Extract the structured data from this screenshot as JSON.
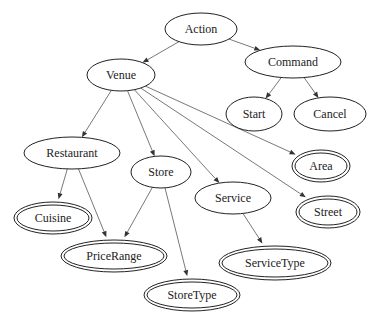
{
  "diagram": {
    "type": "directed-graph",
    "nodes": [
      {
        "id": "action",
        "label": "Action",
        "kind": "single"
      },
      {
        "id": "command",
        "label": "Command",
        "kind": "single"
      },
      {
        "id": "venue",
        "label": "Venue",
        "kind": "single"
      },
      {
        "id": "start",
        "label": "Start",
        "kind": "single"
      },
      {
        "id": "cancel",
        "label": "Cancel",
        "kind": "single"
      },
      {
        "id": "restaurant",
        "label": "Restaurant",
        "kind": "single"
      },
      {
        "id": "store",
        "label": "Store",
        "kind": "single"
      },
      {
        "id": "service",
        "label": "Service",
        "kind": "single"
      },
      {
        "id": "area",
        "label": "Area",
        "kind": "double"
      },
      {
        "id": "street",
        "label": "Street",
        "kind": "double"
      },
      {
        "id": "cuisine",
        "label": "Cuisine",
        "kind": "double"
      },
      {
        "id": "pricerange",
        "label": "PriceRange",
        "kind": "double"
      },
      {
        "id": "servicetype",
        "label": "ServiceType",
        "kind": "double"
      },
      {
        "id": "storetype",
        "label": "StoreType",
        "kind": "double"
      }
    ],
    "edges": [
      {
        "from": "action",
        "to": "venue"
      },
      {
        "from": "action",
        "to": "command"
      },
      {
        "from": "command",
        "to": "start"
      },
      {
        "from": "command",
        "to": "cancel"
      },
      {
        "from": "venue",
        "to": "restaurant"
      },
      {
        "from": "venue",
        "to": "store"
      },
      {
        "from": "venue",
        "to": "service"
      },
      {
        "from": "venue",
        "to": "street"
      },
      {
        "from": "venue",
        "to": "area"
      },
      {
        "from": "restaurant",
        "to": "cuisine"
      },
      {
        "from": "restaurant",
        "to": "pricerange"
      },
      {
        "from": "store",
        "to": "pricerange"
      },
      {
        "from": "store",
        "to": "storetype"
      },
      {
        "from": "service",
        "to": "servicetype"
      }
    ]
  }
}
